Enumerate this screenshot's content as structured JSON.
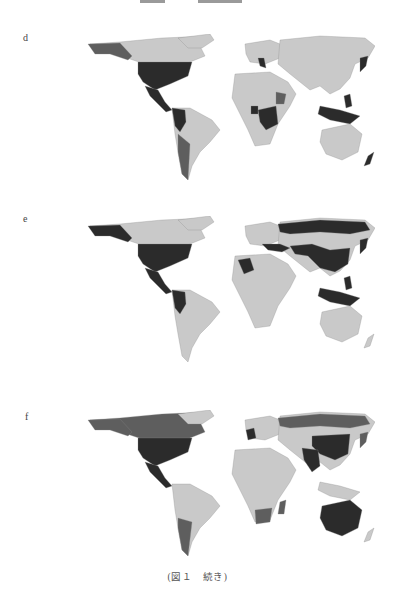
{
  "figure": {
    "caption": "(図１　続き)",
    "panels": [
      {
        "label": "d",
        "highlighted_regions": {
          "darkest": [
            "USA",
            "Mexico",
            "Central America",
            "Colombia",
            "Peru",
            "Ecuador",
            "Italy",
            "DR Congo",
            "Cameroon",
            "Japan",
            "Philippines",
            "Indonesia",
            "Papua New Guinea"
          ],
          "dark": [
            "Alaska",
            "Chile",
            "Argentina",
            "Ethiopia",
            "Greenland/coast"
          ]
        }
      },
      {
        "label": "e",
        "highlighted_regions": {
          "darkest": [
            "USA",
            "Mexico",
            "Alaska",
            "Colombia",
            "Ecuador",
            "Peru",
            "Algeria",
            "Italy",
            "Greece",
            "Turkey",
            "Iran",
            "India",
            "China",
            "Russia",
            "Japan",
            "Philippines",
            "Indonesia",
            "Papua New Guinea"
          ],
          "dark": []
        }
      },
      {
        "label": "f",
        "highlighted_regions": {
          "darkest": [
            "USA",
            "Mexico",
            "China",
            "India",
            "Australia",
            "UK",
            "France",
            "Spain"
          ],
          "dark": [
            "Canada",
            "Alaska",
            "Russia",
            "Argentina",
            "Chile",
            "South Africa",
            "Mozambique",
            "Madagascar",
            "Korea",
            "Japan",
            "Iran",
            "Thailand",
            "Myanmar"
          ]
        }
      }
    ],
    "legend_shades": {
      "base": "#c9c9c9",
      "dark": "#5e5e5e",
      "darkest": "#2b2b2b"
    }
  }
}
